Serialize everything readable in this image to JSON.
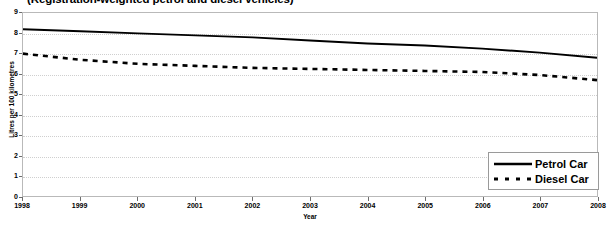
{
  "chart_data": {
    "type": "line",
    "title": "(Registration-weighted petrol and diesel vehicles)",
    "xlabel": "Year",
    "ylabel": "Litres per 100 kilometres",
    "x": [
      1998,
      1999,
      2000,
      2001,
      2002,
      2003,
      2004,
      2005,
      2006,
      2007,
      2008
    ],
    "xlim": [
      1998,
      2008
    ],
    "ylim": [
      0,
      9
    ],
    "y_ticks": [
      0,
      1,
      2,
      3,
      4,
      5,
      6,
      7,
      8,
      9
    ],
    "x_ticks": [
      "1998",
      "1999",
      "2000",
      "2001",
      "2002",
      "2003",
      "2004",
      "2005",
      "2006",
      "2007",
      "2008"
    ],
    "grid": "horizontal-dotted",
    "legend_position": "inside-bottom-right",
    "series": [
      {
        "name": "Petrol Car",
        "style": "solid",
        "color": "#000000",
        "values": [
          8.2,
          8.1,
          8.0,
          7.9,
          7.8,
          7.65,
          7.5,
          7.4,
          7.25,
          7.05,
          6.8
        ]
      },
      {
        "name": "Diesel Car",
        "style": "dashed",
        "color": "#000000",
        "values": [
          7.0,
          6.7,
          6.5,
          6.4,
          6.3,
          6.25,
          6.2,
          6.15,
          6.1,
          5.95,
          5.7
        ]
      }
    ]
  },
  "legend": {
    "items": [
      {
        "label": "Petrol Car",
        "style": "solid"
      },
      {
        "label": "Diesel Car",
        "style": "dashed"
      }
    ]
  }
}
